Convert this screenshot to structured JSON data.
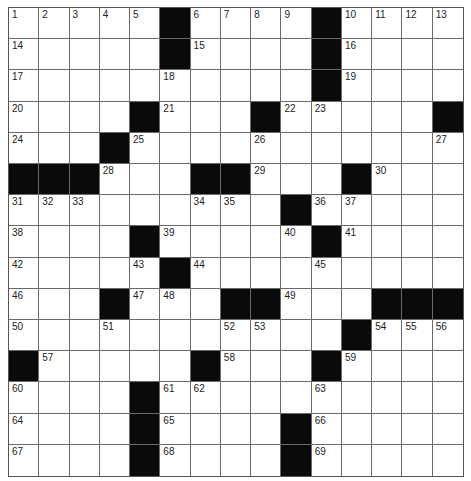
{
  "puzzle": {
    "rows": 15,
    "cols": 15,
    "grid": [
      "....#....#....",
      "....#....#....",
      ".........#....",
      "....#..#....#",
      "...#..........",
      "###...##...#..",
      ".........#.....",
      "....#.....#....",
      ".....#.........",
      "...#...##...###",
      "...........#...",
      "#.....#...#....",
      "....#..........",
      "....#....#.....",
      "....#....#....."
    ],
    "layout": [
      ".....#....#....",
      ".....#....#....",
      "..........#....",
      "....#...#.....#",
      "...#...........",
      "###...##...#...",
      ".........#.....",
      "....#.....#....",
      ".....#.........",
      "...#...##...###",
      "...........#...",
      "#.....#...#....",
      "....#..........",
      "....#....#.....",
      "....#....#....."
    ],
    "numbers": [
      {
        "r": 0,
        "c": 0,
        "n": "1"
      },
      {
        "r": 0,
        "c": 1,
        "n": "2"
      },
      {
        "r": 0,
        "c": 2,
        "n": "3"
      },
      {
        "r": 0,
        "c": 3,
        "n": "4"
      },
      {
        "r": 0,
        "c": 4,
        "n": "5"
      },
      {
        "r": 0,
        "c": 6,
        "n": "6"
      },
      {
        "r": 0,
        "c": 7,
        "n": "7"
      },
      {
        "r": 0,
        "c": 8,
        "n": "8"
      },
      {
        "r": 0,
        "c": 9,
        "n": "9"
      },
      {
        "r": 0,
        "c": 11,
        "n": "10"
      },
      {
        "r": 0,
        "c": 12,
        "n": "11"
      },
      {
        "r": 0,
        "c": 13,
        "n": "12"
      },
      {
        "r": 0,
        "c": 14,
        "n": "13"
      },
      {
        "r": 1,
        "c": 0,
        "n": "14"
      },
      {
        "r": 1,
        "c": 6,
        "n": "15"
      },
      {
        "r": 1,
        "c": 11,
        "n": "16"
      },
      {
        "r": 2,
        "c": 0,
        "n": "17"
      },
      {
        "r": 2,
        "c": 5,
        "n": "18"
      },
      {
        "r": 2,
        "c": 11,
        "n": "19"
      },
      {
        "r": 3,
        "c": 0,
        "n": "20"
      },
      {
        "r": 3,
        "c": 5,
        "n": "21"
      },
      {
        "r": 3,
        "c": 9,
        "n": "22"
      },
      {
        "r": 3,
        "c": 10,
        "n": "23"
      },
      {
        "r": 4,
        "c": 0,
        "n": "24"
      },
      {
        "r": 4,
        "c": 4,
        "n": "25"
      },
      {
        "r": 4,
        "c": 8,
        "n": "26"
      },
      {
        "r": 4,
        "c": 14,
        "n": "27"
      },
      {
        "r": 5,
        "c": 3,
        "n": "28"
      },
      {
        "r": 5,
        "c": 8,
        "n": "29"
      },
      {
        "r": 5,
        "c": 12,
        "n": "30"
      },
      {
        "r": 6,
        "c": 0,
        "n": "31"
      },
      {
        "r": 6,
        "c": 1,
        "n": "32"
      },
      {
        "r": 6,
        "c": 2,
        "n": "33"
      },
      {
        "r": 6,
        "c": 6,
        "n": "34"
      },
      {
        "r": 6,
        "c": 7,
        "n": "35"
      },
      {
        "r": 6,
        "c": 10,
        "n": "36"
      },
      {
        "r": 6,
        "c": 11,
        "n": "37"
      },
      {
        "r": 7,
        "c": 0,
        "n": "38"
      },
      {
        "r": 7,
        "c": 5,
        "n": "39"
      },
      {
        "r": 7,
        "c": 9,
        "n": "40"
      },
      {
        "r": 7,
        "c": 11,
        "n": "41"
      },
      {
        "r": 8,
        "c": 0,
        "n": "42"
      },
      {
        "r": 8,
        "c": 4,
        "n": "43"
      },
      {
        "r": 8,
        "c": 6,
        "n": "44"
      },
      {
        "r": 8,
        "c": 10,
        "n": "45"
      },
      {
        "r": 9,
        "c": 0,
        "n": "46"
      },
      {
        "r": 9,
        "c": 4,
        "n": "47"
      },
      {
        "r": 9,
        "c": 5,
        "n": "48"
      },
      {
        "r": 9,
        "c": 9,
        "n": "49"
      },
      {
        "r": 10,
        "c": 0,
        "n": "50"
      },
      {
        "r": 10,
        "c": 3,
        "n": "51"
      },
      {
        "r": 10,
        "c": 7,
        "n": "52"
      },
      {
        "r": 10,
        "c": 8,
        "n": "53"
      },
      {
        "r": 10,
        "c": 12,
        "n": "54"
      },
      {
        "r": 10,
        "c": 13,
        "n": "55"
      },
      {
        "r": 10,
        "c": 14,
        "n": "56"
      },
      {
        "r": 11,
        "c": 1,
        "n": "57"
      },
      {
        "r": 11,
        "c": 7,
        "n": "58"
      },
      {
        "r": 11,
        "c": 11,
        "n": "59"
      },
      {
        "r": 12,
        "c": 0,
        "n": "60"
      },
      {
        "r": 12,
        "c": 5,
        "n": "61"
      },
      {
        "r": 12,
        "c": 6,
        "n": "62"
      },
      {
        "r": 12,
        "c": 10,
        "n": "63"
      },
      {
        "r": 13,
        "c": 0,
        "n": "64"
      },
      {
        "r": 13,
        "c": 5,
        "n": "65"
      },
      {
        "r": 13,
        "c": 10,
        "n": "66"
      },
      {
        "r": 14,
        "c": 0,
        "n": "67"
      },
      {
        "r": 14,
        "c": 5,
        "n": "68"
      },
      {
        "r": 14,
        "c": 10,
        "n": "69"
      }
    ],
    "letters": {}
  },
  "colors": {
    "block": "#0a0a0a",
    "cell": "#ffffff",
    "gridline": "#6a6a6a"
  }
}
